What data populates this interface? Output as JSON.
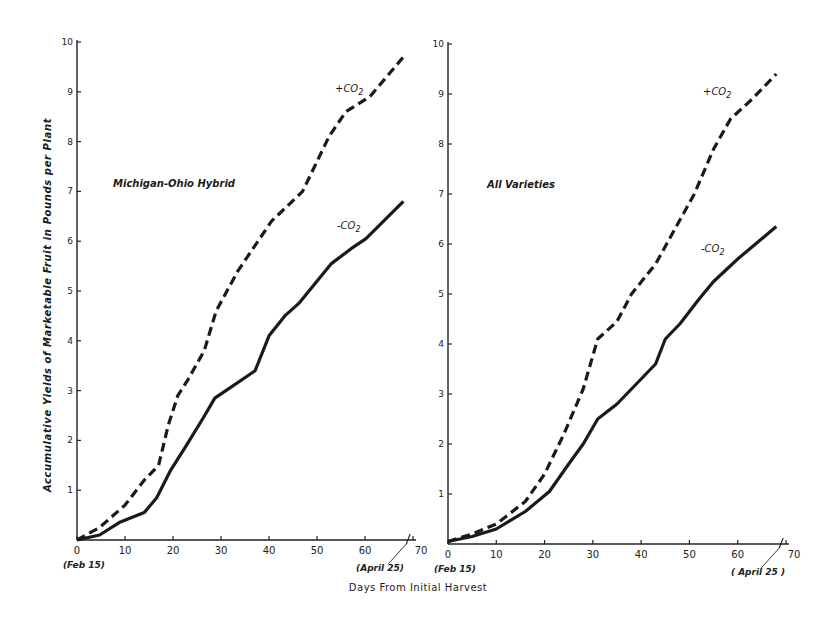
{
  "chart_data": [
    {
      "type": "line",
      "title": "Michigan-Ohio Hybrid",
      "xlabel": "Days From Initial Harvest",
      "ylabel": "Accumulative Yields of Marketable Fruit in Pounds per Plant",
      "xlim": [
        0,
        70
      ],
      "ylim": [
        0,
        10
      ],
      "xticks": [
        0,
        10,
        20,
        30,
        40,
        50,
        60,
        70
      ],
      "yticks": [
        1,
        2,
        3,
        4,
        5,
        6,
        7,
        8,
        9,
        10
      ],
      "x_annotations": {
        "start": "(Feb 15)",
        "end": "(April 25)"
      },
      "grid": false,
      "legend": "inline labels",
      "series": [
        {
          "name": "+CO2",
          "style": "dashed",
          "x": [
            0,
            4.7,
            10,
            14,
            17,
            19,
            21,
            23,
            26.5,
            29,
            33.5,
            40.5,
            47,
            50,
            52.5,
            56,
            61,
            68
          ],
          "y": [
            0,
            0.25,
            0.7,
            1.2,
            1.5,
            2.3,
            2.9,
            3.2,
            3.8,
            4.6,
            5.4,
            6.4,
            7.0,
            7.6,
            8.1,
            8.6,
            8.9,
            9.7
          ]
        },
        {
          "name": "-CO2",
          "style": "solid",
          "x": [
            0,
            4.7,
            8.8,
            14,
            16.6,
            19.5,
            22.8,
            26.3,
            28.7,
            31.8,
            37.1,
            40,
            43.3,
            46.2,
            53,
            57.1,
            60.2,
            68
          ],
          "y": [
            0,
            0.1,
            0.35,
            0.55,
            0.85,
            1.4,
            1.9,
            2.45,
            2.85,
            3.05,
            3.4,
            4.1,
            4.5,
            4.75,
            5.55,
            5.85,
            6.05,
            6.8
          ]
        }
      ]
    },
    {
      "type": "line",
      "title": "All Varieties",
      "xlabel": "Days From Initial Harvest",
      "ylabel": "",
      "xlim": [
        0,
        70
      ],
      "ylim": [
        0,
        10
      ],
      "xticks": [
        0,
        10,
        20,
        30,
        40,
        50,
        60,
        70
      ],
      "yticks": [
        1,
        2,
        3,
        4,
        5,
        6,
        7,
        8,
        9,
        10
      ],
      "x_annotations": {
        "start": "(Feb 15)",
        "end": "(April 25)"
      },
      "grid": false,
      "legend": "inline labels",
      "series": [
        {
          "name": "+CO2",
          "style": "dashed",
          "x": [
            0,
            5,
            10,
            16,
            20,
            24,
            28,
            31,
            35,
            38,
            43,
            47,
            51,
            55,
            58.5,
            63,
            68
          ],
          "y": [
            0.05,
            0.2,
            0.4,
            0.85,
            1.4,
            2.2,
            3.1,
            4.1,
            4.45,
            5.0,
            5.6,
            6.3,
            7.0,
            7.9,
            8.5,
            8.9,
            9.4
          ]
        },
        {
          "name": "-CO2",
          "style": "solid",
          "x": [
            0,
            5,
            10,
            16,
            21,
            25,
            28,
            31,
            35,
            39,
            43,
            45,
            48,
            52,
            55,
            60,
            68
          ],
          "y": [
            0.05,
            0.15,
            0.3,
            0.65,
            1.05,
            1.6,
            2.0,
            2.5,
            2.8,
            3.2,
            3.6,
            4.1,
            4.4,
            4.9,
            5.25,
            5.7,
            6.35
          ]
        }
      ]
    }
  ],
  "labels": {
    "left_title": "Michigan-Ohio Hybrid",
    "right_title": "All Varieties",
    "plus_co2": "+CO",
    "minus_co2": "-CO",
    "subscript": "2",
    "xlabel": "Days From Initial Harvest",
    "ylabel": "Accumulative Yields of Marketable Fruit in Pounds per Plant",
    "feb": "(Feb 15)",
    "april_left": "(April 25)",
    "april_right": "( April 25 )"
  },
  "ticks": {
    "x": [
      "0",
      "10",
      "20",
      "30",
      "40",
      "50",
      "60",
      "70"
    ],
    "y": [
      "1",
      "2",
      "3",
      "4",
      "5",
      "6",
      "7",
      "8",
      "9",
      "10"
    ]
  }
}
